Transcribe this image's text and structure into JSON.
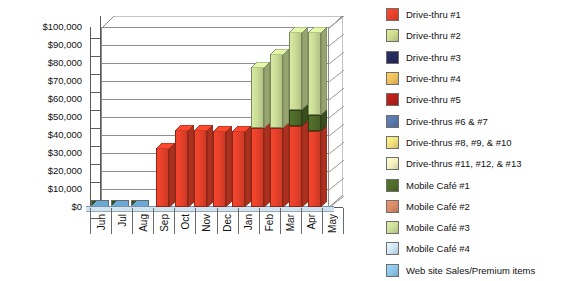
{
  "chart_data": {
    "type": "bar",
    "subtype": "stacked-column-3d",
    "title": "",
    "xlabel": "",
    "ylabel": "",
    "grid": true,
    "legend_position": "right",
    "ylim": [
      0,
      100000
    ],
    "ytick_step": 10000,
    "ytick_labels": [
      "$100,000",
      "$90,000",
      "$80,000",
      "$70,000",
      "$60,000",
      "$50,000",
      "$40,000",
      "$30,000",
      "$20,000",
      "$10,000",
      "$0"
    ],
    "ytick_values": [
      100000,
      90000,
      80000,
      70000,
      60000,
      50000,
      40000,
      30000,
      20000,
      10000,
      0
    ],
    "categories": [
      "Jun",
      "Jul",
      "Aug",
      "Sep",
      "Oct",
      "Nov",
      "Dec",
      "Jan",
      "Feb",
      "Mar",
      "Apr",
      "May"
    ],
    "series": [
      {
        "name": "Drive-thru #1",
        "color": "#E8412A",
        "values": [
          0,
          0,
          0,
          33000,
          43000,
          43000,
          42000,
          42000,
          44000,
          44000,
          45000,
          42000
        ]
      },
      {
        "name": "Drive-thru #2",
        "color": "#CBD98D",
        "values": [
          0,
          0,
          0,
          0,
          0,
          0,
          0,
          0,
          0,
          0,
          0,
          0
        ]
      },
      {
        "name": "Drive-thru #3",
        "color": "#252A5C",
        "values": [
          0,
          0,
          0,
          0,
          0,
          0,
          0,
          0,
          0,
          0,
          0,
          0
        ]
      },
      {
        "name": "Drive-thru #4",
        "color": "#EEC05A",
        "values": [
          0,
          0,
          0,
          0,
          0,
          0,
          0,
          0,
          0,
          0,
          0,
          0
        ]
      },
      {
        "name": "Drive-thru #5",
        "color": "#B51F1B",
        "values": [
          0,
          0,
          0,
          0,
          0,
          0,
          0,
          0,
          0,
          0,
          0,
          0
        ]
      },
      {
        "name": "Drive-thrus #6 & #7",
        "color": "#5977A8",
        "values": [
          0,
          0,
          0,
          0,
          0,
          0,
          0,
          0,
          0,
          0,
          0,
          0
        ]
      },
      {
        "name": "Drive-thrus #8, #9, & #10",
        "color": "#F1E07C",
        "values": [
          0,
          0,
          0,
          0,
          0,
          0,
          0,
          0,
          0,
          0,
          0,
          0
        ]
      },
      {
        "name": "Drive-thrus #11, #12, & #13",
        "color": "#F6F0BE",
        "values": [
          0,
          0,
          0,
          0,
          0,
          0,
          0,
          0,
          0,
          0,
          0,
          0
        ]
      },
      {
        "name": "Mobile Café #1",
        "color": "#4F6B28",
        "values": [
          0,
          0,
          0,
          0,
          0,
          0,
          0,
          0,
          0,
          0,
          9000,
          9000
        ]
      },
      {
        "name": "Mobile Café #2",
        "color": "#D98A66",
        "values": [
          0,
          0,
          0,
          0,
          0,
          0,
          0,
          0,
          0,
          0,
          0,
          0
        ]
      },
      {
        "name": "Mobile Café #3",
        "color": "#CBDD97",
        "values": [
          0,
          0,
          0,
          0,
          0,
          0,
          0,
          0,
          34000,
          41000,
          43000,
          46000
        ]
      },
      {
        "name": "Mobile Café #4",
        "color": "#CFE5F4",
        "values": [
          0,
          0,
          0,
          0,
          0,
          0,
          0,
          0,
          0,
          0,
          0,
          0
        ]
      },
      {
        "name": "Web site Sales/Premium items",
        "color": "#8CC4E8",
        "values": [
          400,
          400,
          400,
          0,
          0,
          0,
          0,
          0,
          0,
          0,
          0,
          0
        ]
      }
    ],
    "totals": [
      400,
      400,
      400,
      33000,
      43000,
      43000,
      42000,
      42000,
      78000,
      85000,
      97000,
      97000
    ]
  },
  "legend": {
    "items": [
      {
        "label": "Drive-thru #1",
        "color": "#E8412A"
      },
      {
        "label": "Drive-thru #2",
        "color": "#CBD98D"
      },
      {
        "label": "Drive-thru #3",
        "color": "#252A5C"
      },
      {
        "label": "Drive-thru #4",
        "color": "#EEC05A"
      },
      {
        "label": "Drive-thru #5",
        "color": "#B51F1B"
      },
      {
        "label": "Drive-thrus #6 & #7",
        "color": "#5977A8"
      },
      {
        "label": "Drive-thrus #8, #9, & #10",
        "color": "#F1E07C"
      },
      {
        "label": "Drive-thrus #11, #12, & #13",
        "color": "#F6F0BE"
      },
      {
        "label": "Mobile Café #1",
        "color": "#4F6B28"
      },
      {
        "label": "Mobile Café #2",
        "color": "#D98A66"
      },
      {
        "label": "Mobile Café #3",
        "color": "#CBDD97"
      },
      {
        "label": "Mobile Café #4",
        "color": "#CFE5F4"
      },
      {
        "label": "Web site Sales/Premium items",
        "color": "#8CC4E8"
      }
    ]
  }
}
